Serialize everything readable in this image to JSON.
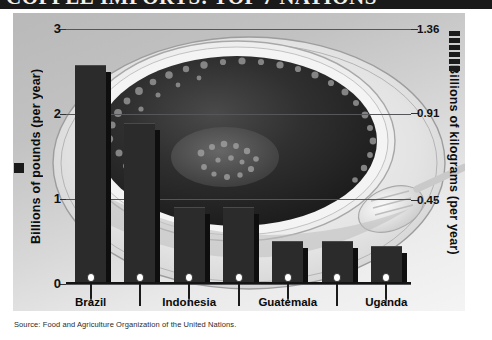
{
  "title": {
    "text": "COFFEE IMPORTS: TOP 7 NATIONS",
    "cropped": true
  },
  "axes": {
    "left_title": "Billions of pounds (per year)",
    "right_title": "Billions of kilograms (per year)",
    "left_ticks": [
      "0",
      "1",
      "2",
      "3"
    ],
    "right_ticks": [
      "0.45",
      "0.91",
      "1.36"
    ]
  },
  "source": {
    "label": "Source: Food and Agriculture Organization of the United Nations."
  },
  "icons": {
    "coffee_cup": "coffee-cup-icon",
    "spoon": "spoon-icon",
    "left_marker": "square-marker-icon",
    "right_marker": "stacked-bars-marker-icon"
  },
  "colors": {
    "bar": "#2b2b2b",
    "bar_shadow": "#0e0e0e",
    "gridline": "#55555a",
    "axis": "#141414",
    "panel_light": "#f4f4f4",
    "panel_dark": "#b9b9b9",
    "text": "#0b0b0b"
  },
  "chart_data": {
    "type": "bar",
    "title": "COFFEE IMPORTS: TOP 7 NATIONS",
    "xlabel": "",
    "ylabel": "Billions of pounds (per year)",
    "ylabel_secondary": "Billions of kilograms (per year)",
    "categories": [
      "Brazil",
      "Colombia",
      "Indonesia",
      "Mexico",
      "Guatemala",
      "Ethiopia",
      "Uganda"
    ],
    "values": [
      2.56,
      1.88,
      0.9,
      0.9,
      0.49,
      0.49,
      0.44
    ],
    "units": "billions of pounds per year",
    "ylim": [
      0,
      3
    ],
    "yticks": [
      0,
      1,
      2,
      3
    ],
    "secondary_ylim": [
      0,
      1.36
    ],
    "secondary_yticks": [
      0.45,
      0.91,
      1.36
    ],
    "secondary_units": "billions of kilograms per year",
    "grid": true,
    "legend": "none",
    "series": [
      {
        "name": "Coffee exports",
        "values": [
          2.56,
          1.88,
          0.9,
          0.9,
          0.49,
          0.49,
          0.44
        ]
      }
    ],
    "points": [
      {
        "category": "Brazil",
        "value": 2.56,
        "value_kg": 1.16,
        "label_row": "top"
      },
      {
        "category": "Colombia",
        "value": 1.88,
        "value_kg": 0.85,
        "label_row": "bottom"
      },
      {
        "category": "Indonesia",
        "value": 0.9,
        "value_kg": 0.41,
        "label_row": "top"
      },
      {
        "category": "Mexico",
        "value": 0.9,
        "value_kg": 0.41,
        "label_row": "bottom"
      },
      {
        "category": "Guatemala",
        "value": 0.49,
        "value_kg": 0.22,
        "label_row": "top"
      },
      {
        "category": "Ethiopia",
        "value": 0.49,
        "value_kg": 0.22,
        "label_row": "bottom"
      },
      {
        "category": "Uganda",
        "value": 0.44,
        "value_kg": 0.2,
        "label_row": "top"
      }
    ],
    "source": "Source: Food and Agriculture Organization of the United Nations."
  }
}
